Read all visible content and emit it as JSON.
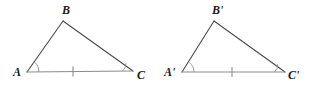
{
  "figure": {
    "type": "geometry-diagram",
    "background_color": "#ffffff",
    "stroke_color": "#4a4a4a",
    "baseline_color": "#8c8c8c",
    "mark_color": "#8c8c8c",
    "label_color": "#1a1a1a"
  },
  "triangles": [
    {
      "id": "left",
      "vertices": {
        "A": {
          "label": "A",
          "x": 27,
          "y": 72,
          "label_x": 13,
          "label_y": 66
        },
        "B": {
          "label": "B",
          "x": 63,
          "y": 21,
          "label_x": 62,
          "label_y": 4
        },
        "C": {
          "label": "C",
          "x": 133,
          "y": 71,
          "label_x": 137,
          "label_y": 69
        }
      },
      "angle_arcs": [
        {
          "at": "A",
          "radius": 11
        },
        {
          "at": "C",
          "radius": 10
        }
      ],
      "tick_marks": [
        {
          "on": "AC",
          "x": 73,
          "y": 71
        }
      ]
    },
    {
      "id": "right",
      "vertices": {
        "A": {
          "label": "A'",
          "x": 182,
          "y": 72,
          "label_x": 164,
          "label_y": 66
        },
        "B": {
          "label": "B'",
          "x": 214,
          "y": 21,
          "label_x": 212,
          "label_y": 4
        },
        "C": {
          "label": "C'",
          "x": 285,
          "y": 72,
          "label_x": 288,
          "label_y": 69
        }
      },
      "angle_arcs": [
        {
          "at": "A",
          "radius": 11
        },
        {
          "at": "C",
          "radius": 10
        }
      ],
      "tick_marks": [
        {
          "on": "AC",
          "x": 232,
          "y": 72
        }
      ]
    }
  ]
}
